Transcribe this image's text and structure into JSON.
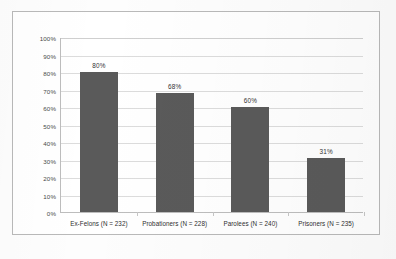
{
  "chart_data": {
    "type": "bar",
    "title": "",
    "xlabel": "",
    "ylabel": "",
    "categories": [
      "Ex-Felons (N = 232)",
      "Probationers (N = 228)",
      "Parolees (N = 240)",
      "Prisoners (N = 235)"
    ],
    "values": [
      80,
      68,
      60,
      31
    ],
    "data_labels": [
      "80%",
      "68%",
      "60%",
      "31%"
    ],
    "ylim": [
      0,
      100
    ],
    "ytick_labels": [
      "100%",
      "90%",
      "80%",
      "70%",
      "60%",
      "50%",
      "40%",
      "30%",
      "20%",
      "10%",
      "0%"
    ],
    "ytick_values": [
      100,
      90,
      80,
      70,
      60,
      50,
      40,
      30,
      20,
      10,
      0
    ],
    "grid": true,
    "legend": "none",
    "bar_color": "#5a5a5a",
    "gridline_color": "#dcdcdc",
    "axis_color": "#bdbdbd",
    "frame_color": "#b9b9b9",
    "background": "#ffffff"
  }
}
